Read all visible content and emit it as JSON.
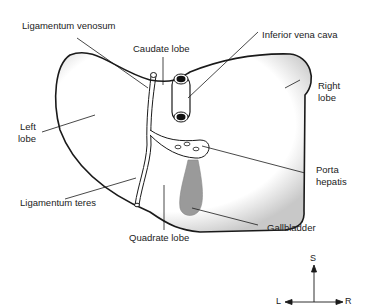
{
  "diagram": {
    "labels": {
      "ligamentum_venosum": "Ligamentum venosum",
      "caudate_lobe": "Caudate lobe",
      "inferior_vena_cava": "Inferior vena cava",
      "right_lobe_1": "Right",
      "right_lobe_2": "lobe",
      "left_lobe_1": "Left",
      "left_lobe_2": "lobe",
      "porta_hepatis_1": "Porta",
      "porta_hepatis_2": "hepatis",
      "ligamentum_teres": "Ligamentum teres",
      "quadrate_lobe": "Quadrate lobe",
      "gallbladder": "Gallbladder"
    },
    "compass": {
      "superior": "S",
      "left": "L",
      "right": "R"
    },
    "colors": {
      "outline": "#1a1a1a",
      "gallbladder_fill": "#9a9a9a",
      "shadow": "#bdbdbd",
      "label_text": "#222222"
    }
  }
}
